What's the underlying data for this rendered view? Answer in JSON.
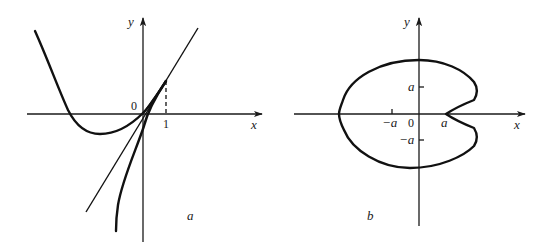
{
  "panel_a": {
    "caption": "a",
    "axis_x_label": "x",
    "axis_y_label": "y",
    "origin_label": "0",
    "tick_x_1_label": "1",
    "elements": [
      "cubic-curve",
      "tangent-line",
      "inverse-curve",
      "dashed-guide-at-x-1"
    ]
  },
  "panel_b": {
    "caption": "b",
    "axis_x_label": "x",
    "axis_y_label": "y",
    "origin_label": "0",
    "tick_x_neg_a": "−a",
    "tick_x_pos_a": "a",
    "tick_y_pos_a": "a",
    "tick_y_neg_a": "−a",
    "elements": [
      "closed-cardioid-like-curve-with-cusp-at-a"
    ]
  },
  "colors": {
    "ink": "#111111",
    "background": "#ffffff"
  }
}
